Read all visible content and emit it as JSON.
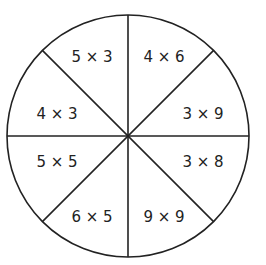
{
  "diagram": {
    "type": "multiplication-wheel",
    "stroke_color": "#222222",
    "background": "#ffffff",
    "center": [
      128,
      136
    ],
    "radius": 121,
    "segments": [
      {
        "position": "top-left-upper",
        "label": "5 × 3"
      },
      {
        "position": "top-right-upper",
        "label": "4 × 6"
      },
      {
        "position": "right-upper",
        "label": "3 × 9"
      },
      {
        "position": "right-lower",
        "label": "3 × 8"
      },
      {
        "position": "bottom-right-lower",
        "label": "9 × 9"
      },
      {
        "position": "bottom-left-lower",
        "label": "6 × 5"
      },
      {
        "position": "left-lower",
        "label": "5 × 5"
      },
      {
        "position": "left-upper",
        "label": "4 × 3"
      }
    ]
  }
}
